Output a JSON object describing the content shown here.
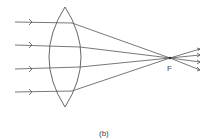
{
  "diagram": {
    "focal_label": "F",
    "caption": "(b)",
    "colors": {
      "line": "#555555",
      "background": "#ffffff"
    },
    "lens": {
      "cx": 65,
      "top": 7,
      "bottom": 107,
      "half_width": 16
    },
    "focal_point": {
      "x": 170,
      "y": 58
    },
    "incident_rays_y": [
      22,
      45,
      69,
      92
    ],
    "ray_start_x": 15,
    "arrow_head_x": 32,
    "exit_end_x": 200
  }
}
